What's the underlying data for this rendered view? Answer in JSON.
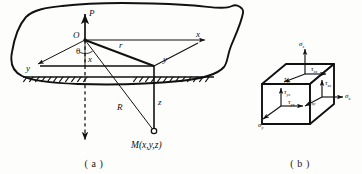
{
  "figure": {
    "captions": {
      "a": "( a )",
      "b": "( b )"
    }
  },
  "panel_a": {
    "name": "half-space-point-load",
    "labels": {
      "load": "P",
      "origin": "O",
      "axis_x": "x",
      "axis_y": "y",
      "depth_x": "x",
      "depth_y": "y",
      "depth_z": "z",
      "radial_r": "r",
      "slant_R": "R",
      "angle_theta": "θ",
      "point_M": "M(x,y,z)"
    },
    "colors": {
      "line": "#111111",
      "ground": "#111111",
      "paper": "#fdfdfb"
    }
  },
  "panel_b": {
    "name": "stress-element-cube",
    "labels": {
      "sigma_z": "σ",
      "sigma_z_sub": "z",
      "sigma_x": "σ",
      "sigma_x_sub": "x",
      "sigma_y": "σ",
      "sigma_y_sub": "y",
      "tau_zx": "τ",
      "tau_zx_sub": "zx",
      "tau_zy": "τ",
      "tau_zy_sub": "zy",
      "tau_yz": "τ",
      "tau_yz_sub": "yz",
      "tau_yx": "τ",
      "tau_yx_sub": "yx",
      "tau_xz": "τ",
      "tau_xz_sub": "xz",
      "tau_xy": "τ",
      "tau_xy_sub": "xy"
    },
    "colors": {
      "line": "#111111",
      "face": "#ffffff"
    }
  }
}
